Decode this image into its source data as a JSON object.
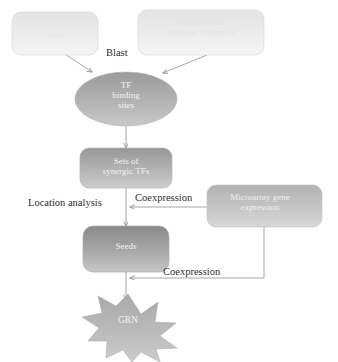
{
  "diagram": {
    "palette": {
      "node_fill_light_top": "#e6e6e6",
      "node_fill_light_bottom": "#f4f4f4",
      "node_fill_mid_top": "#9a9a9a",
      "node_fill_mid_bottom": "#c9c9c9",
      "node_fill_dark_top": "#8d8d8d",
      "node_fill_dark_bottom": "#bdbdbd",
      "ellipse_top": "#9e9e9e",
      "ellipse_bottom": "#c4c4c4",
      "star_fill": "#b5b5b5",
      "edge_stroke": "#9c9c9c",
      "node_stroke": "#cfcfcf",
      "text_dark": "#2e2e2e",
      "text_light": "#f2f2f2",
      "background": "#ffffff"
    },
    "nodes": [
      {
        "id": "tf-binding-motifs",
        "shape": "rounded-rect",
        "label": "TF binding\nmotifs",
        "tone": "light"
      },
      {
        "id": "genome-wide-promoter-sequences",
        "shape": "rounded-rect",
        "label": "Genome-wide\npromoter sequences",
        "tone": "light"
      },
      {
        "id": "tf-binding-sites",
        "shape": "ellipse",
        "label": "TF\nbinding\nsites",
        "tone": "mid"
      },
      {
        "id": "sets-of-synergic-tfs",
        "shape": "rounded-rect",
        "label": "Sets of\nsynergic TFs",
        "tone": "mid"
      },
      {
        "id": "microarray-gene-expression",
        "shape": "rounded-rect",
        "label": "Microarray gene\nexpression",
        "tone": "mid-light"
      },
      {
        "id": "seeds",
        "shape": "rounded-rect",
        "label": "Seeds",
        "tone": "dark"
      },
      {
        "id": "grn",
        "shape": "starburst",
        "label": "GRN",
        "tone": "mid"
      }
    ],
    "edges": [
      {
        "id": "motifs-to-sites",
        "from": "tf-binding-motifs",
        "to": "tf-binding-sites",
        "label": "Blast"
      },
      {
        "id": "promoters-to-sites",
        "from": "genome-wide-promoter-sequences",
        "to": "tf-binding-sites",
        "label": ""
      },
      {
        "id": "sites-to-synergic",
        "from": "tf-binding-sites",
        "to": "sets-of-synergic-tfs",
        "label": ""
      },
      {
        "id": "synergic-to-seeds",
        "from": "sets-of-synergic-tfs",
        "to": "seeds",
        "label": "Location analysis"
      },
      {
        "id": "microarray-to-seeds",
        "from": "microarray-gene-expression",
        "to": "seeds",
        "label": "Coexpression"
      },
      {
        "id": "microarray-to-grn",
        "from": "microarray-gene-expression",
        "to": "grn",
        "label": "Coexpression"
      },
      {
        "id": "seeds-to-grn",
        "from": "seeds",
        "to": "grn",
        "label": ""
      }
    ],
    "edge_labels": {
      "blast": "Blast",
      "location_analysis": "Location analysis",
      "coexpression_1": "Coexpression",
      "coexpression_2": "Coexpression"
    }
  }
}
